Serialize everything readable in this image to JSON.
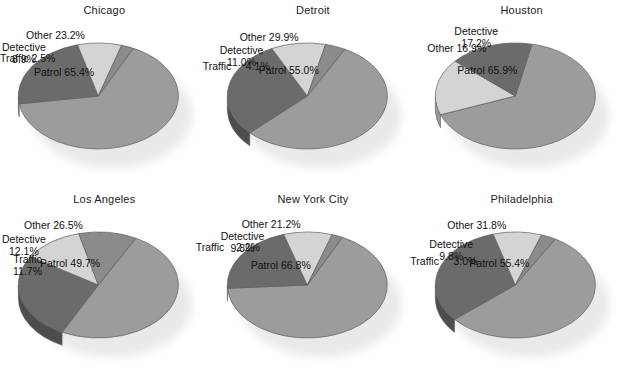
{
  "figure": {
    "background_color": "#ffffff",
    "text_color": "#111111",
    "panel_count": 6
  },
  "palette": {
    "patrol": "#9c9c9c",
    "other": "#6b6b6b",
    "detective": "#d4d4d4",
    "traffic": "#8b8b8b",
    "shadow": "#e9e9e9",
    "edge": "#5f5f5f"
  },
  "chart_data": [
    {
      "type": "pie",
      "title": "Chicago",
      "categories": [
        "Patrol",
        "Other",
        "Detective",
        "Traffic"
      ],
      "values": [
        65.4,
        23.2,
        8.9,
        2.5
      ],
      "labels": [
        "Patrol 65.4%",
        "Other 23.2%",
        "Detective\n8.9%",
        "Traffic 2.5%"
      ],
      "colors": [
        "#9c9c9c",
        "#6b6b6b",
        "#d4d4d4",
        "#8b8b8b"
      ],
      "unit": "%",
      "start_angle": 64,
      "label_positions": [
        {
          "x": 34,
          "y": 66,
          "align": "center"
        },
        {
          "x": 26,
          "y": 29,
          "align": "center"
        },
        {
          "x": 2,
          "y": 41,
          "align": "center"
        },
        {
          "x": 0,
          "y": 52,
          "align": "left"
        }
      ]
    },
    {
      "type": "pie",
      "title": "Detroit",
      "categories": [
        "Patrol",
        "Other",
        "Detective",
        "Traffic"
      ],
      "values": [
        55.0,
        29.9,
        11.0,
        4.1
      ],
      "labels": [
        "Patrol 55.0%",
        "Other 29.9%",
        "Detective\n11.0%",
        "Traffic     4.1%"
      ],
      "colors": [
        "#9c9c9c",
        "#6b6b6b",
        "#d4d4d4",
        "#8b8b8b"
      ],
      "unit": "%",
      "start_angle": 62,
      "label_positions": [
        {
          "x": 50,
          "y": 64,
          "align": "center"
        },
        {
          "x": 31,
          "y": 31,
          "align": "center"
        },
        {
          "x": 11,
          "y": 44,
          "align": "center"
        },
        {
          "x": -6,
          "y": 60,
          "align": "left"
        }
      ]
    },
    {
      "type": "pie",
      "title": "Houston",
      "categories": [
        "Patrol",
        "Detective",
        "Other"
      ],
      "values": [
        65.9,
        17.2,
        16.9
      ],
      "labels": [
        "Patrol 65.9%",
        "Detective\n17.2%",
        "Other 16.9%"
      ],
      "colors": [
        "#9c9c9c",
        "#d4d4d4",
        "#6b6b6b"
      ],
      "unit": "%",
      "start_angle": 78,
      "label_positions": [
        {
          "x": 40,
          "y": 64,
          "align": "center"
        },
        {
          "x": 37,
          "y": 25,
          "align": "center"
        },
        {
          "x": 10,
          "y": 42,
          "align": "center"
        }
      ]
    },
    {
      "type": "pie",
      "title": "Los Angeles",
      "categories": [
        "Patrol",
        "Other",
        "Detective",
        "Traffic"
      ],
      "values": [
        49.7,
        26.5,
        12.1,
        11.7
      ],
      "labels": [
        "Patrol 49.7%",
        "Other 26.5%",
        "Detective\n12.1%",
        "Traffic\n11.7%"
      ],
      "colors": [
        "#9c9c9c",
        "#6b6b6b",
        "#d4d4d4",
        "#8b8b8b"
      ],
      "unit": "%",
      "start_angle": 62,
      "label_positions": [
        {
          "x": 40,
          "y": 68,
          "align": "center"
        },
        {
          "x": 24,
          "y": 30,
          "align": "center"
        },
        {
          "x": 2,
          "y": 44,
          "align": "center"
        },
        {
          "x": 13,
          "y": 64,
          "align": "center"
        }
      ]
    },
    {
      "type": "pie",
      "title": "New York City",
      "categories": [
        "Patrol",
        "Other",
        "Detective",
        "Traffic"
      ],
      "values": [
        66.8,
        21.2,
        9.8,
        2.2
      ],
      "labels": [
        "Patrol 66.8%",
        "Other 21.2%",
        "Detective\n9.8%",
        "Traffic    2.2%"
      ],
      "colors": [
        "#9c9c9c",
        "#6b6b6b",
        "#d4d4d4",
        "#8b8b8b"
      ],
      "unit": "%",
      "start_angle": 64,
      "label_positions": [
        {
          "x": 42,
          "y": 70,
          "align": "center"
        },
        {
          "x": 33,
          "y": 29,
          "align": "center"
        },
        {
          "x": 12,
          "y": 41,
          "align": "center"
        },
        {
          "x": -13,
          "y": 52,
          "align": "left"
        }
      ]
    },
    {
      "type": "pie",
      "title": "Philadelphia",
      "categories": [
        "Patrol",
        "Other",
        "Detective",
        "Traffic"
      ],
      "values": [
        55.4,
        31.8,
        9.8,
        3.0
      ],
      "labels": [
        "Patrol 55.4%",
        "Other 31.8%",
        "Detective\n9.8%",
        "Traffic     3.0%"
      ],
      "colors": [
        "#9c9c9c",
        "#6b6b6b",
        "#d4d4d4",
        "#8b8b8b"
      ],
      "unit": "%",
      "start_angle": 60,
      "label_positions": [
        {
          "x": 52,
          "y": 68,
          "align": "center"
        },
        {
          "x": 30,
          "y": 30,
          "align": "center"
        },
        {
          "x": 12,
          "y": 49,
          "align": "center"
        },
        {
          "x": -7,
          "y": 66,
          "align": "left"
        }
      ]
    }
  ]
}
